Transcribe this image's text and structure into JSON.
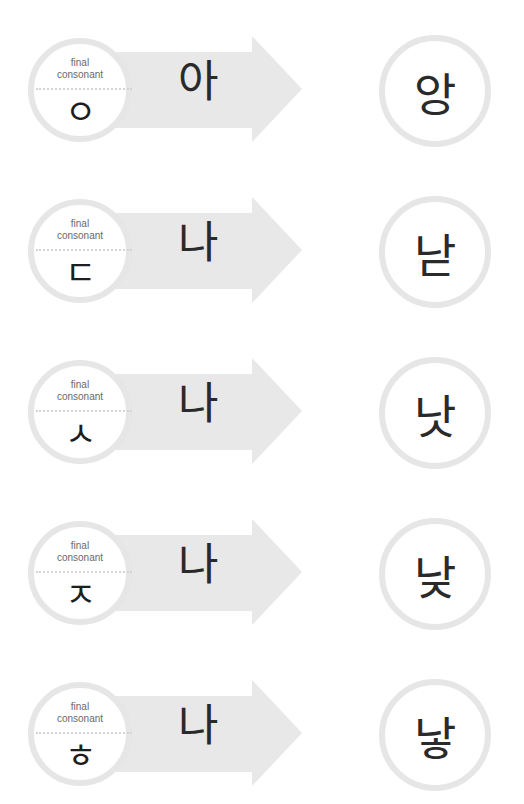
{
  "label_line1": "final",
  "label_line2": "consonant",
  "colors": {
    "arrow": "#e8e8e8",
    "circle_ring": "#e6e6e6",
    "text": "#2a2a2a",
    "label": "#6a6a6a"
  },
  "rows": [
    {
      "final_consonant": "ㅇ",
      "syllable": "아",
      "result": "앙"
    },
    {
      "final_consonant": "ㄷ",
      "syllable": "나",
      "result": "낟"
    },
    {
      "final_consonant": "ㅅ",
      "syllable": "나",
      "result": "낫"
    },
    {
      "final_consonant": "ㅈ",
      "syllable": "나",
      "result": "낮"
    },
    {
      "final_consonant": "ㅎ",
      "syllable": "나",
      "result": "낳"
    }
  ]
}
